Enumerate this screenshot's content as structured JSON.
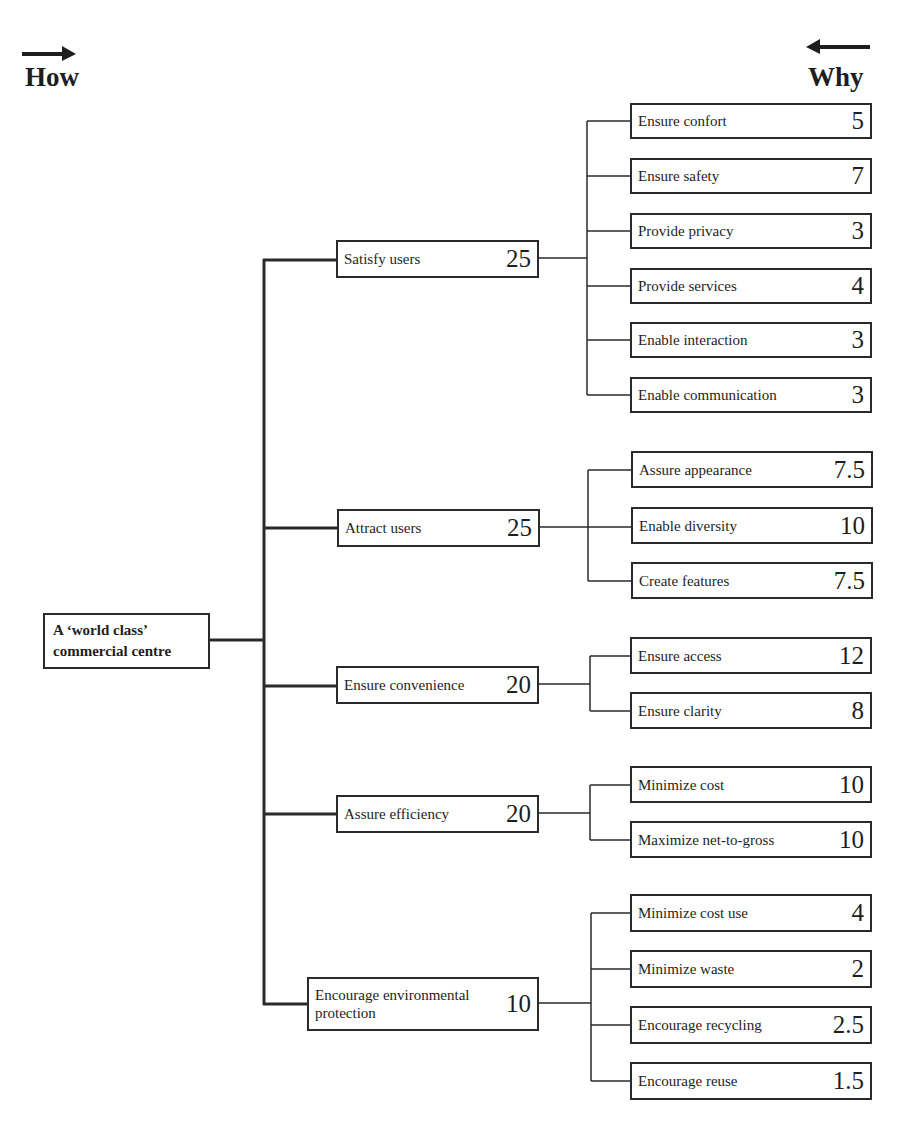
{
  "headers": {
    "left": "How",
    "right": "Why"
  },
  "root": {
    "line1": "A ‘world class’",
    "line2": "commercial centre"
  },
  "mid": [
    {
      "label": "Satisfy users",
      "value": "25"
    },
    {
      "label": "Attract users",
      "value": "25"
    },
    {
      "label": "Ensure convenience",
      "value": "20"
    },
    {
      "label": "Assure efficiency",
      "value": "20"
    },
    {
      "label": "Encourage environmental protection",
      "line1": "Encourage environmental",
      "line2": "protection",
      "value": "10"
    }
  ],
  "leaves": [
    {
      "label": "Ensure confort",
      "value": "5"
    },
    {
      "label": "Ensure safety",
      "value": "7"
    },
    {
      "label": "Provide privacy",
      "value": "3"
    },
    {
      "label": "Provide services",
      "value": "4"
    },
    {
      "label": "Enable interaction",
      "value": "3"
    },
    {
      "label": "Enable communication",
      "value": "3"
    },
    {
      "label": "Assure appearance",
      "value": "7.5"
    },
    {
      "label": "Enable diversity",
      "value": "10"
    },
    {
      "label": "Create features",
      "value": "7.5"
    },
    {
      "label": "Ensure access",
      "value": "12"
    },
    {
      "label": "Ensure clarity",
      "value": "8"
    },
    {
      "label": "Minimize cost",
      "value": "10"
    },
    {
      "label": "Maximize net-to-gross",
      "value": "10"
    },
    {
      "label": "Minimize cost use",
      "value": "4"
    },
    {
      "label": "Minimize waste",
      "value": "2"
    },
    {
      "label": "Encourage recycling",
      "value": "2.5"
    },
    {
      "label": "Encourage reuse",
      "value": "1.5"
    }
  ]
}
